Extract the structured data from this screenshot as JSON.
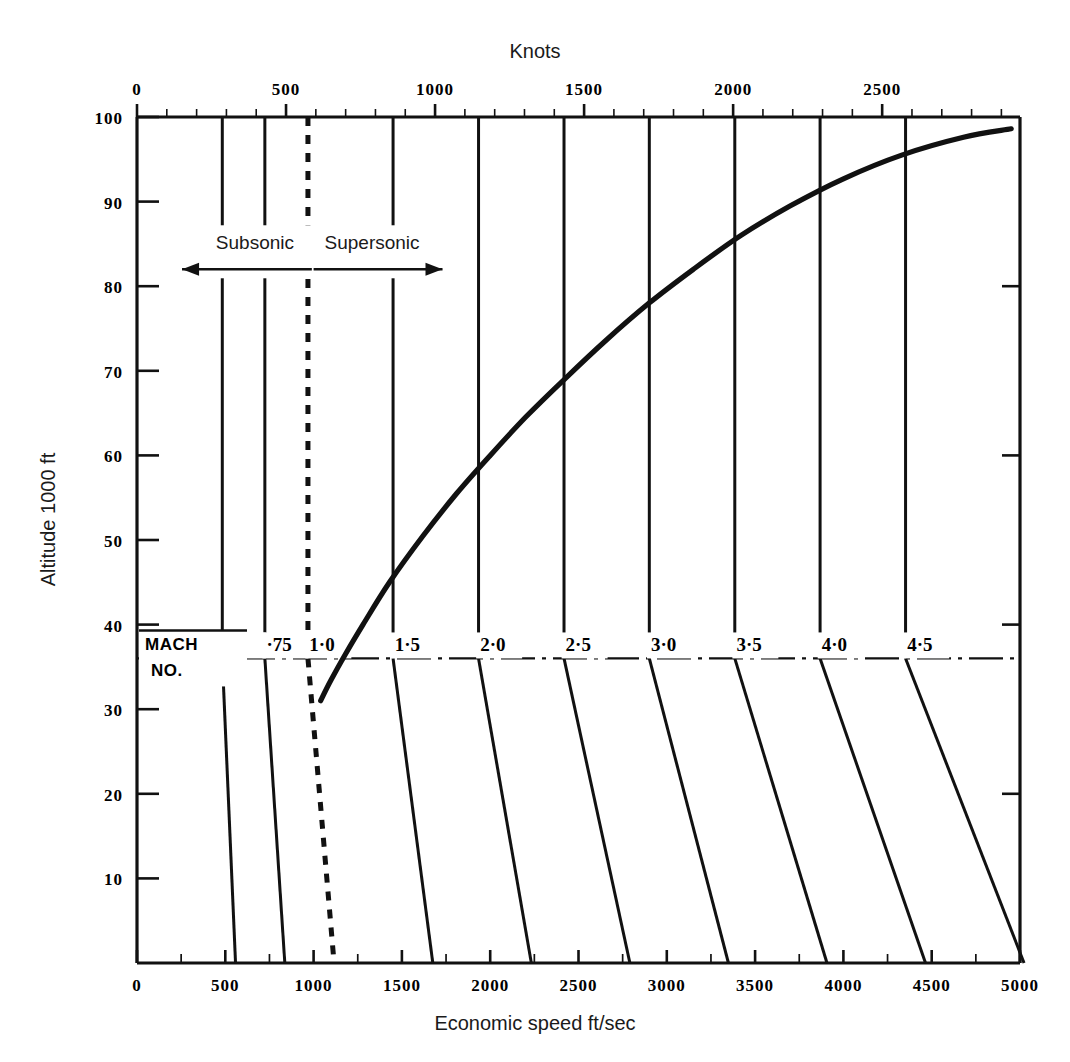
{
  "figure": {
    "top_axis_title": "Knots",
    "bottom_axis_title": "Economic speed ft/sec",
    "left_axis_title": "Altitude 1000 ft"
  },
  "annotations": {
    "subsonic_label": "Subsonic",
    "supersonic_label": "Supersonic",
    "mach_caption_line1": "MACH",
    "mach_caption_line2": "NO."
  },
  "chart_data": {
    "type": "line",
    "title": "Knots",
    "xlabel": "Economic speed ft/sec",
    "ylabel": "Altitude 1000 ft",
    "xlim": [
      0,
      5000
    ],
    "ylim": [
      0,
      100
    ],
    "grid": false,
    "legend": "none",
    "x_ticks_bottom": [
      "0",
      "500",
      "1000",
      "1500",
      "2000",
      "2500",
      "3000",
      "3500",
      "4000",
      "4500",
      "5000"
    ],
    "x_tick_values_bottom": [
      0,
      500,
      1000,
      1500,
      2000,
      2500,
      3000,
      3500,
      4000,
      4500,
      5000
    ],
    "x_minor_step_bottom": 250,
    "top_axis_unit": "knots",
    "top_axis_conversion_ft_per_sec_per_knot": 1.6878,
    "x_ticks_top": [
      "0",
      "500",
      "1000",
      "1500",
      "2000",
      "2500"
    ],
    "x_tick_values_top": [
      0,
      500,
      1000,
      1500,
      2000,
      2500
    ],
    "x_minor_step_top": 100,
    "y_ticks": [
      "100",
      "90",
      "80",
      "70",
      "60",
      "50",
      "40",
      "30",
      "20",
      "10"
    ],
    "y_tick_values": [
      100,
      90,
      80,
      70,
      60,
      50,
      40,
      30,
      20,
      10
    ],
    "tropopause_altitude": 36,
    "mach_lines": [
      {
        "label": "·5",
        "mach": 0.5,
        "style": "solid",
        "x_at_tropopause": 483,
        "x_at_sea_level": 558,
        "x_at_100k": 483,
        "label_x": 492
      },
      {
        "label": "·75",
        "mach": 0.75,
        "style": "solid",
        "x_at_tropopause": 724,
        "x_at_sea_level": 837,
        "x_at_100k": 724,
        "label_x": 733
      },
      {
        "label": "1·0",
        "mach": 1.0,
        "style": "dashed",
        "x_at_tropopause": 968,
        "x_at_sea_level": 1116,
        "x_at_100k": 968,
        "label_x": 976
      },
      {
        "label": "1·5",
        "mach": 1.5,
        "style": "solid",
        "x_at_tropopause": 1450,
        "x_at_sea_level": 1675,
        "x_at_100k": 1450,
        "label_x": 1459
      },
      {
        "label": "2·0",
        "mach": 2.0,
        "style": "solid",
        "x_at_tropopause": 1934,
        "x_at_sea_level": 2233,
        "x_at_100k": 1934,
        "label_x": 1943
      },
      {
        "label": "2·5",
        "mach": 2.5,
        "style": "solid",
        "x_at_tropopause": 2418,
        "x_at_sea_level": 2791,
        "x_at_100k": 2418,
        "label_x": 2427
      },
      {
        "label": "3·0",
        "mach": 3.0,
        "style": "solid",
        "x_at_tropopause": 2901,
        "x_at_sea_level": 3349,
        "x_at_100k": 2901,
        "label_x": 2910
      },
      {
        "label": "3·5",
        "mach": 3.5,
        "style": "solid",
        "x_at_tropopause": 3385,
        "x_at_sea_level": 3907,
        "x_at_100k": 3385,
        "label_x": 3394
      },
      {
        "label": "4·0",
        "mach": 4.0,
        "style": "solid",
        "x_at_tropopause": 3868,
        "x_at_sea_level": 4465,
        "x_at_100k": 3868,
        "label_x": 3877
      },
      {
        "label": "4·5",
        "mach": 4.5,
        "style": "solid",
        "x_at_tropopause": 4352,
        "x_at_sea_level": 5023,
        "x_at_100k": 4352,
        "label_x": 4361
      }
    ],
    "series": [
      {
        "name": "Economic speed",
        "style": "solid-thick",
        "points": [
          [
            1040,
            31.0
          ],
          [
            1100,
            33.5
          ],
          [
            1180,
            36.5
          ],
          [
            1280,
            40.0
          ],
          [
            1430,
            45.0
          ],
          [
            1620,
            50.5
          ],
          [
            1810,
            55.5
          ],
          [
            2000,
            60.0
          ],
          [
            2200,
            64.5
          ],
          [
            2420,
            69.0
          ],
          [
            2650,
            73.5
          ],
          [
            2900,
            78.0
          ],
          [
            3150,
            82.0
          ],
          [
            3420,
            86.0
          ],
          [
            3700,
            89.5
          ],
          [
            4000,
            92.7
          ],
          [
            4330,
            95.5
          ],
          [
            4680,
            97.6
          ],
          [
            4950,
            98.6
          ]
        ]
      }
    ],
    "subsonic_arrow": {
      "from_x": 990,
      "to_x": 255,
      "altitude": 82
    },
    "supersonic_arrow": {
      "from_x": 1000,
      "to_x": 1730,
      "altitude": 82
    }
  },
  "colors": {
    "ink": "#111111",
    "paper": "#ffffff"
  }
}
